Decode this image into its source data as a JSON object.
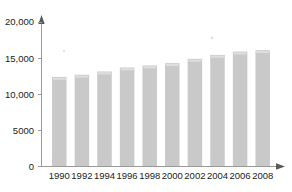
{
  "chart_data": {
    "type": "bar",
    "title": "",
    "subtitle": "",
    "xlabel": "",
    "ylabel": "",
    "categories": [
      "1990",
      "1992",
      "1994",
      "1996",
      "1998",
      "2000",
      "2002",
      "2004",
      "2006",
      "2008"
    ],
    "values": [
      12400,
      12700,
      13150,
      13700,
      13980,
      14300,
      14900,
      15450,
      15900,
      16100
    ],
    "series": [
      {
        "name": "",
        "values": [
          12400,
          12700,
          13150,
          13700,
          13980,
          14300,
          14900,
          15450,
          15900,
          16100
        ]
      }
    ],
    "ylim": [
      0,
      20000
    ],
    "y_ticks": [
      0,
      5000,
      10000,
      15000,
      20000
    ],
    "y_tick_labels": [
      "0",
      "5000",
      "10,000",
      "15,000",
      "20,000"
    ],
    "x_tick_labels": [
      "1990",
      "1992",
      "1994",
      "1996",
      "1998",
      "2000",
      "2002",
      "2004",
      "2006",
      "2008"
    ],
    "grid": false,
    "legend": false,
    "legend_position": "none",
    "annotations": [],
    "bar_color": "#c9c9c9",
    "axis_color": "#9a9a9a",
    "text_color": "#222222",
    "background_color": "#ffffff"
  }
}
